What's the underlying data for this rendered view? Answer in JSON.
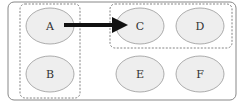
{
  "diagram": {
    "nodes": [
      {
        "id": "A",
        "label": "A",
        "cx": 50,
        "cy": 26,
        "rx": 24,
        "ry": 18
      },
      {
        "id": "B",
        "label": "B",
        "cx": 50,
        "cy": 74,
        "rx": 24,
        "ry": 18
      },
      {
        "id": "C",
        "label": "C",
        "cx": 140,
        "cy": 26,
        "rx": 24,
        "ry": 18
      },
      {
        "id": "D",
        "label": "D",
        "cx": 200,
        "cy": 26,
        "rx": 24,
        "ry": 18
      },
      {
        "id": "E",
        "label": "E",
        "cx": 140,
        "cy": 74,
        "rx": 24,
        "ry": 18
      },
      {
        "id": "F",
        "label": "F",
        "cx": 200,
        "cy": 74,
        "rx": 24,
        "ry": 18
      }
    ],
    "groups": [
      {
        "id": "group-left",
        "members": [
          "A",
          "B"
        ]
      },
      {
        "id": "group-top-right",
        "members": [
          "C",
          "D"
        ]
      }
    ],
    "edges": [
      {
        "from": "A",
        "to": "C",
        "style": "thick-arrow"
      }
    ],
    "colors": {
      "node_fill": "#eeeeee",
      "node_stroke": "#999999",
      "border": "#888888",
      "arrow": "#111111",
      "dashed": "#777777"
    }
  }
}
